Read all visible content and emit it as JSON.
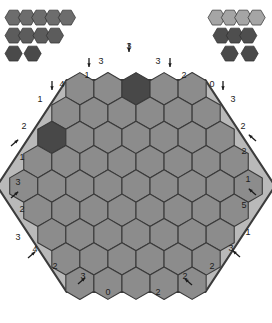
{
  "app": {
    "title": "Hexagon tile placement puzzle",
    "top_note": ""
  },
  "colors": {
    "page_background": "#ffffff",
    "board_frame": "#b9b9b9",
    "board_frame_edge": "#3c3c3c",
    "cell_fill": "#8c8c8c",
    "cell_stroke": "#3a3a3a",
    "piece_dark": "#484848",
    "piece_medium": "#6d6d6d",
    "piece_light": "#a5a5a5",
    "label_text": "#1c1c1c",
    "arrow": "#1c1c1c"
  },
  "board": {
    "name": "hex-board",
    "rows": [
      5,
      6,
      7,
      8,
      9,
      8,
      7,
      6,
      5
    ],
    "total_cells": 61,
    "placed_pieces": [
      {
        "row": 0,
        "col": 2,
        "color": "#484848",
        "label": "top-center-dark-hex"
      },
      {
        "row": 2,
        "col": 0,
        "color": "#484848",
        "label": "upper-left-dark-hex"
      }
    ]
  },
  "clues": {
    "top": [
      {
        "value": "3",
        "arrow": "down",
        "arrow_side": "left",
        "x": 129,
        "y": 47,
        "ax": 129,
        "ay": 47
      },
      {
        "value": "3",
        "arrow": "down",
        "arrow_side": "right",
        "x": 101,
        "y": 62,
        "ax": 89,
        "ay": 62
      },
      {
        "value": "3",
        "arrow": "down",
        "arrow_side": "right",
        "x": 158,
        "y": 62,
        "ax": 170,
        "ay": 62
      },
      {
        "value": "1",
        "arrow": "none",
        "arrow_side": "",
        "x": 87,
        "y": 76,
        "ax": 0,
        "ay": 0
      },
      {
        "value": "2",
        "arrow": "none",
        "arrow_side": "",
        "x": 184,
        "y": 76,
        "ax": 0,
        "ay": 0
      },
      {
        "value": "4",
        "arrow": "down",
        "arrow_side": "right",
        "x": 62,
        "y": 85,
        "ax": 52,
        "ay": 85
      },
      {
        "value": "0",
        "arrow": "down",
        "arrow_side": "right",
        "x": 212,
        "y": 85,
        "ax": 223,
        "ay": 85
      },
      {
        "value": "1",
        "arrow": "none",
        "arrow_side": "",
        "x": 40,
        "y": 100,
        "ax": 0,
        "ay": 0
      },
      {
        "value": "3",
        "arrow": "none",
        "arrow_side": "",
        "x": 233,
        "y": 100,
        "ax": 0,
        "ay": 0
      }
    ],
    "left": [
      {
        "value": "2",
        "arrow": "none",
        "x": 24,
        "y": 127,
        "ax": 0,
        "ay": 0
      },
      {
        "value": "1",
        "arrow": "upright",
        "x": 22,
        "y": 158,
        "ax": 11,
        "ay": 150
      },
      {
        "value": "3",
        "arrow": "none",
        "x": 18,
        "y": 183,
        "ax": 0,
        "ay": 0
      },
      {
        "value": "2",
        "arrow": "upright",
        "x": 22,
        "y": 210,
        "ax": 11,
        "ay": 202
      },
      {
        "value": "3",
        "arrow": "none",
        "x": 18,
        "y": 238,
        "ax": 0,
        "ay": 0
      },
      {
        "value": "4",
        "arrow": "upright",
        "x": 35,
        "y": 250,
        "ax": 28,
        "ay": 262
      },
      {
        "value": "2",
        "arrow": "none",
        "x": 55,
        "y": 267,
        "ax": 0,
        "ay": 0
      },
      {
        "value": "3",
        "arrow": "upright",
        "x": 83,
        "y": 277,
        "ax": 78,
        "ay": 288
      },
      {
        "value": "0",
        "arrow": "none",
        "x": 108,
        "y": 293,
        "ax": 0,
        "ay": 0
      }
    ],
    "right": [
      {
        "value": "2",
        "arrow": "none",
        "x": 243,
        "y": 127,
        "ax": 0,
        "ay": 0
      },
      {
        "value": "2",
        "arrow": "upleft",
        "x": 244,
        "y": 152,
        "ax": 256,
        "ay": 145
      },
      {
        "value": "1",
        "arrow": "none",
        "x": 248,
        "y": 180,
        "ax": 0,
        "ay": 0
      },
      {
        "value": "5",
        "arrow": "upleft",
        "x": 244,
        "y": 206,
        "ax": 256,
        "ay": 199
      },
      {
        "value": "1",
        "arrow": "none",
        "x": 248,
        "y": 233,
        "ax": 0,
        "ay": 0
      },
      {
        "value": "3",
        "arrow": "upleft",
        "x": 231,
        "y": 249,
        "ax": 240,
        "ay": 261
      },
      {
        "value": "2",
        "arrow": "none",
        "x": 212,
        "y": 267,
        "ax": 0,
        "ay": 0
      },
      {
        "value": "2",
        "arrow": "upleft",
        "x": 185,
        "y": 277,
        "ax": 192,
        "ay": 289
      },
      {
        "value": "2",
        "arrow": "none",
        "x": 158,
        "y": 293,
        "ax": 0,
        "ay": 0
      }
    ]
  },
  "tray_left": {
    "name": "left-piece-tray",
    "groups": [
      {
        "id": "L1",
        "count": 5,
        "color": "#6d6d6d",
        "x": 5,
        "y": 9,
        "shape": "line-5"
      },
      {
        "id": "L2",
        "count": 2,
        "color": "#5c5c5c",
        "x": 5,
        "y": 27,
        "shape": "line-2"
      },
      {
        "id": "L3",
        "count": 2,
        "color": "#5c5c5c",
        "x": 33,
        "y": 27,
        "shape": "line-2"
      },
      {
        "id": "L4",
        "count": 1,
        "color": "#4a4a4a",
        "x": 5,
        "y": 45,
        "shape": "single"
      },
      {
        "id": "L5",
        "count": 1,
        "color": "#4a4a4a",
        "x": 24,
        "y": 45,
        "shape": "single"
      }
    ]
  },
  "tray_right": {
    "name": "right-piece-tray",
    "groups": [
      {
        "id": "R1",
        "count": 4,
        "color": "#a5a5a5",
        "x": 208,
        "y": 9,
        "shape": "line-4"
      },
      {
        "id": "R2",
        "count": 3,
        "color": "#4e4e4e",
        "x": 213,
        "y": 27,
        "shape": "line-3"
      },
      {
        "id": "R3",
        "count": 1,
        "color": "#4a4a4a",
        "x": 221,
        "y": 45,
        "shape": "single"
      },
      {
        "id": "R4",
        "count": 1,
        "color": "#4a4a4a",
        "x": 241,
        "y": 45,
        "shape": "single"
      }
    ]
  }
}
